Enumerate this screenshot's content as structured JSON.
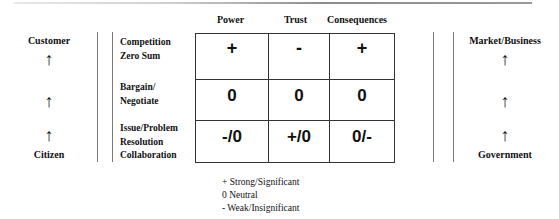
{
  "columns": [
    "Power",
    "Trust",
    "Consequences"
  ],
  "rows": [
    {
      "label_lines": [
        "Competition",
        "Zero Sum"
      ],
      "cells": [
        "+",
        "-",
        "+"
      ]
    },
    {
      "label_lines": [
        "Bargain/",
        "Negotiate"
      ],
      "cells": [
        "0",
        "0",
        "0"
      ]
    },
    {
      "label_lines": [
        "Issue/Problem",
        "Resolution",
        "Collaboration"
      ],
      "cells": [
        "-/0",
        "+/0",
        "0/-"
      ]
    }
  ],
  "left_axis": {
    "top": "Customer",
    "bottom": "Citizen",
    "arrow": "↑"
  },
  "right_axis": {
    "top": "Market/Business",
    "bottom": "Government",
    "arrow": "↑"
  },
  "legend": [
    "+ Strong/Significant",
    "0 Neutral",
    "- Weak/Insignificant"
  ]
}
